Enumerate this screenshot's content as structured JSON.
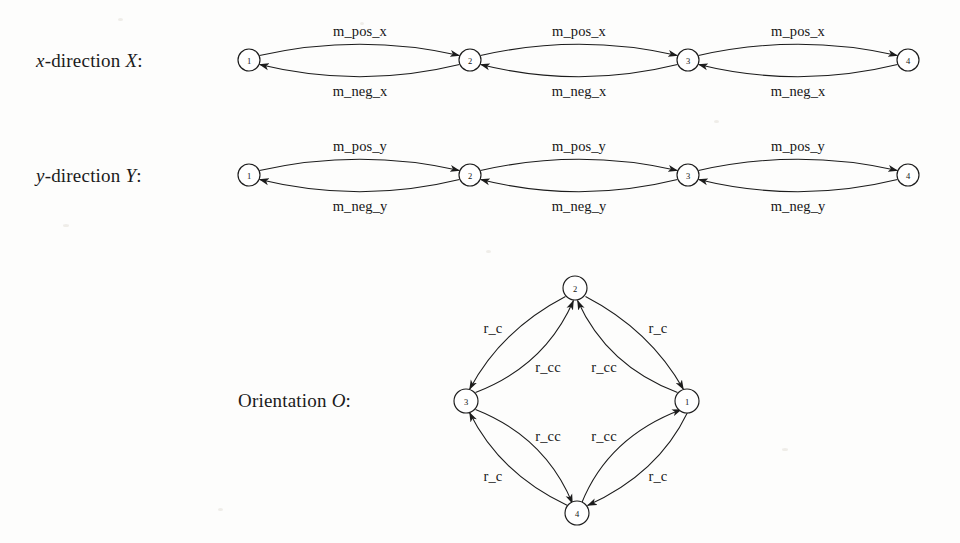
{
  "figure": {
    "title_rows": [
      {
        "id": "x-direction",
        "prefix": "x",
        "rest": "-direction ",
        "symbol": "X",
        "colon": ":"
      },
      {
        "id": "y-direction",
        "prefix": "y",
        "rest": "-direction ",
        "symbol": "Y",
        "colon": ":"
      }
    ],
    "orientation_label": {
      "text": "Orientation ",
      "symbol": "O",
      "colon": ":"
    }
  },
  "graphs": {
    "x_direction": {
      "label_plain": "x-direction X:",
      "nodes": [
        {
          "id": "n1",
          "label": "1",
          "cx": 249,
          "cy": 60,
          "r": 11
        },
        {
          "id": "n2",
          "label": "2",
          "cx": 470,
          "cy": 60,
          "r": 11
        },
        {
          "id": "n3",
          "label": "3",
          "cx": 688,
          "cy": 60,
          "r": 11
        },
        {
          "id": "n4",
          "label": "4",
          "cx": 908,
          "cy": 60,
          "r": 11
        }
      ],
      "edges": [
        {
          "id": "e1",
          "from": "1",
          "to": "2",
          "label": "m_pos_x",
          "label_x": 360,
          "label_y": 31,
          "side": "top"
        },
        {
          "id": "e2",
          "from": "2",
          "to": "1",
          "label": "m_neg_x",
          "label_x": 360,
          "label_y": 91,
          "side": "bottom"
        },
        {
          "id": "e3",
          "from": "2",
          "to": "3",
          "label": "m_pos_x",
          "label_x": 579,
          "label_y": 31,
          "side": "top"
        },
        {
          "id": "e4",
          "from": "3",
          "to": "2",
          "label": "m_neg_x",
          "label_x": 579,
          "label_y": 91,
          "side": "bottom"
        },
        {
          "id": "e5",
          "from": "3",
          "to": "4",
          "label": "m_pos_x",
          "label_x": 798,
          "label_y": 31,
          "side": "top"
        },
        {
          "id": "e6",
          "from": "4",
          "to": "3",
          "label": "m_neg_x",
          "label_x": 798,
          "label_y": 91,
          "side": "bottom"
        }
      ]
    },
    "y_direction": {
      "label_plain": "y-direction Y:",
      "nodes": [
        {
          "id": "n1",
          "label": "1",
          "cx": 249,
          "cy": 175,
          "r": 11
        },
        {
          "id": "n2",
          "label": "2",
          "cx": 470,
          "cy": 175,
          "r": 11
        },
        {
          "id": "n3",
          "label": "3",
          "cx": 688,
          "cy": 175,
          "r": 11
        },
        {
          "id": "n4",
          "label": "4",
          "cx": 908,
          "cy": 175,
          "r": 11
        }
      ],
      "edges": [
        {
          "id": "e1",
          "from": "1",
          "to": "2",
          "label": "m_pos_y",
          "label_x": 360,
          "label_y": 146,
          "side": "top"
        },
        {
          "id": "e2",
          "from": "2",
          "to": "1",
          "label": "m_neg_y",
          "label_x": 360,
          "label_y": 206,
          "side": "bottom"
        },
        {
          "id": "e3",
          "from": "2",
          "to": "3",
          "label": "m_pos_y",
          "label_x": 579,
          "label_y": 146,
          "side": "top"
        },
        {
          "id": "e4",
          "from": "3",
          "to": "2",
          "label": "m_neg_y",
          "label_x": 579,
          "label_y": 206,
          "side": "bottom"
        },
        {
          "id": "e5",
          "from": "3",
          "to": "4",
          "label": "m_pos_y",
          "label_x": 798,
          "label_y": 146,
          "side": "top"
        },
        {
          "id": "e6",
          "from": "4",
          "to": "3",
          "label": "m_neg_y",
          "label_x": 798,
          "label_y": 206,
          "side": "bottom"
        }
      ]
    },
    "orientation": {
      "label_plain": "Orientation O:",
      "nodes": [
        {
          "id": "top",
          "label": "2",
          "cx": 575,
          "cy": 288,
          "r": 12
        },
        {
          "id": "left",
          "label": "3",
          "cx": 466,
          "cy": 401,
          "r": 12
        },
        {
          "id": "right",
          "label": "1",
          "cx": 687,
          "cy": 401,
          "r": 12
        },
        {
          "id": "bottom",
          "label": "4",
          "cx": 577,
          "cy": 513,
          "r": 12
        }
      ],
      "edges": [
        {
          "id": "o1",
          "from": "2",
          "to": "3",
          "label": "r_c",
          "label_x": 493,
          "label_y": 328
        },
        {
          "id": "o2",
          "from": "3",
          "to": "2",
          "label": "r_cc",
          "label_x": 548,
          "label_y": 367
        },
        {
          "id": "o3",
          "from": "2",
          "to": "1",
          "label": "r_c",
          "label_x": 658,
          "label_y": 328
        },
        {
          "id": "o4",
          "from": "1",
          "to": "2",
          "label": "r_cc",
          "label_x": 604,
          "label_y": 367
        },
        {
          "id": "o5",
          "from": "3",
          "to": "4",
          "label": "r_cc",
          "label_x": 548,
          "label_y": 436
        },
        {
          "id": "o6",
          "from": "4",
          "to": "3",
          "label": "r_c",
          "label_x": 493,
          "label_y": 476
        },
        {
          "id": "o7",
          "from": "4",
          "to": "1",
          "label": "r_cc",
          "label_x": 604,
          "label_y": 436
        },
        {
          "id": "o8",
          "from": "1",
          "to": "4",
          "label": "r_c",
          "label_x": 658,
          "label_y": 476
        }
      ]
    }
  },
  "colors": {
    "ink": "#1c1c1c",
    "background": "#fdfdfc"
  }
}
